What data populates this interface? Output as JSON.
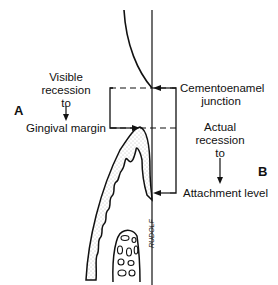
{
  "diagram": {
    "labels": {
      "side_a": "A",
      "side_b": "B",
      "visible_recession_line1": "Visible",
      "visible_recession_line2": "recession",
      "visible_recession_line3": "to",
      "gingival_margin": "Gingival margin",
      "cej_line1": "Cementoenamel",
      "cej_line2": "junction",
      "actual_recession_line1": "Actual",
      "actual_recession_line2": "recession",
      "actual_recession_line3": "to",
      "attachment_level": "Attachment level",
      "signature": "RUDOLF"
    },
    "colors": {
      "line": "#111111",
      "stipple": "#9a9a9a",
      "background": "#ffffff"
    }
  }
}
